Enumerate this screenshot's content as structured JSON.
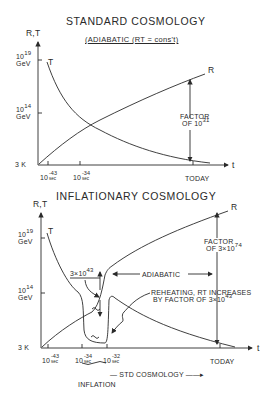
{
  "colors": {
    "ink": "#2a2a2a",
    "background": "#ffffff"
  },
  "top": {
    "title": "STANDARD COSMOLOGY",
    "subtitle": "(ADIABATIC (RT = cons't)",
    "y_axis_label": "R,T",
    "x_axis_label": "t",
    "y_ticks": [
      {
        "mant": "10",
        "exp": "19",
        "unit": "GeV"
      },
      {
        "mant": "10",
        "exp": "14",
        "unit": "GeV"
      },
      {
        "label": "3 K"
      }
    ],
    "x_ticks": [
      {
        "mant": "10",
        "exp": "-43",
        "unit": "sec"
      },
      {
        "mant": "10",
        "exp": "-34",
        "unit": "sec"
      },
      {
        "label": "TODAY"
      }
    ],
    "curve_T_label": "T",
    "curve_R_label": "R",
    "factor_line1": "FACTOR",
    "factor_line2": "OF 10",
    "factor_exp": "31"
  },
  "bottom": {
    "title": "INFLATIONARY COSMOLOGY",
    "y_axis_label": "R,T",
    "x_axis_label": "t",
    "y_ticks": [
      {
        "mant": "10",
        "exp": "19",
        "unit": "GeV"
      },
      {
        "mant": "10",
        "exp": "14",
        "unit": "GeV"
      },
      {
        "label": "3 K"
      }
    ],
    "x_ticks": [
      {
        "mant": "10",
        "exp": "-43",
        "unit": "sec"
      },
      {
        "mant": "10",
        "exp": "-34",
        "unit": "sec"
      },
      {
        "mant": "10",
        "exp": "-32",
        "unit": "sec"
      },
      {
        "label": "TODAY"
      }
    ],
    "curve_T_label": "T",
    "curve_R_label": "R",
    "inflation_factor": "3×10",
    "inflation_factor_exp": "43",
    "adiabatic_label": "ADIABATIC",
    "reheating_line1": "REHEATING, RT INCREASES",
    "reheating_line2": "BY FACTOR OF 3×10",
    "reheating_exp": "43",
    "factor_line1": "FACTOR",
    "factor_line2": "OF 3×10",
    "factor_exp": "74",
    "std_cosmology_label": "— STD COSMOLOGY ——▸",
    "inflation_label": "INFLATION"
  }
}
